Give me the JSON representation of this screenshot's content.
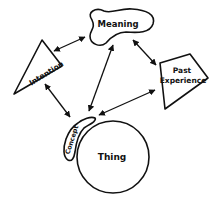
{
  "diagram": {
    "type": "concept-relationship diagram",
    "nodes": {
      "meaning": {
        "label": "Meaning",
        "shape": "blob"
      },
      "intention": {
        "label": "Intention",
        "shape": "triangle"
      },
      "past_experience": {
        "label_line1": "Past",
        "label_line2": "Experience",
        "shape": "pentagon"
      },
      "concept": {
        "label": "Concept",
        "shape": "curved-blob"
      },
      "thing": {
        "label": "Thing",
        "shape": "circle"
      }
    },
    "edges": [
      {
        "from": "intention",
        "to": "meaning",
        "direction": "both"
      },
      {
        "from": "meaning",
        "to": "past_experience",
        "direction": "both"
      },
      {
        "from": "meaning",
        "to": "concept",
        "direction": "both"
      },
      {
        "from": "intention",
        "to": "concept",
        "direction": "both"
      },
      {
        "from": "past_experience",
        "to": "concept",
        "direction": "both"
      }
    ],
    "colors": {
      "stroke": "#111111",
      "background": "#ffffff"
    }
  }
}
